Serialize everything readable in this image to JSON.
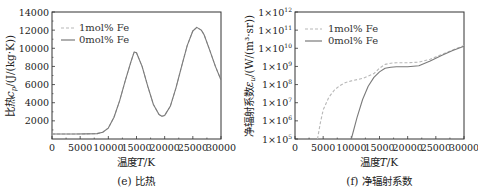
{
  "chart_data": [
    {
      "type": "line",
      "title": "",
      "caption": "(e) 比热",
      "xlabel": "温度T/K",
      "ylabel": "比热c_p/(J/(kg·K))",
      "xlim": [
        0,
        30000
      ],
      "ylim": [
        0,
        14000
      ],
      "x_ticks": [
        "0",
        "5000",
        "10000",
        "15000",
        "20000",
        "25000",
        "30000"
      ],
      "y_ticks": [
        "2000",
        "4000",
        "6000",
        "8000",
        "10000",
        "12000",
        "14000"
      ],
      "grid": false,
      "legend_position": "upper left",
      "x": [
        0,
        2000,
        4000,
        6000,
        8000,
        9000,
        10000,
        11000,
        12000,
        13000,
        14000,
        14600,
        15000,
        16000,
        17000,
        18000,
        19000,
        19500,
        20000,
        21000,
        22000,
        23000,
        24000,
        25000,
        25700,
        26500,
        27000,
        28000,
        29000,
        30000
      ],
      "series": [
        {
          "name": "1mol% Fe",
          "style": "dashed",
          "values": [
            550,
            550,
            550,
            560,
            600,
            750,
            1200,
            2400,
            4200,
            6400,
            8500,
            9600,
            9500,
            8000,
            5800,
            3800,
            2700,
            2500,
            2600,
            3600,
            5600,
            8000,
            10300,
            11900,
            12300,
            12000,
            11500,
            9800,
            8000,
            6500
          ]
        },
        {
          "name": "0mol% Fe",
          "style": "solid",
          "values": [
            550,
            550,
            550,
            560,
            600,
            750,
            1200,
            2400,
            4200,
            6400,
            8500,
            9600,
            9500,
            8000,
            5800,
            3800,
            2700,
            2500,
            2600,
            3600,
            5600,
            8000,
            10300,
            11900,
            12300,
            12000,
            11500,
            9800,
            8000,
            6500
          ]
        }
      ]
    },
    {
      "type": "line",
      "title": "",
      "caption": "(f) 净辐射系数",
      "xlabel": "温度T/K",
      "ylabel": "净辐射系数ε_u/(W/(m³·sr))",
      "xlim": [
        0,
        30000
      ],
      "ylim": [
        100000,
        1000000000000
      ],
      "yscale": "log",
      "x_ticks": [
        "0",
        "5000",
        "10000",
        "15000",
        "20000",
        "25000",
        "30000"
      ],
      "y_ticks": [
        "1×10^5",
        "1×10^6",
        "1×10^7",
        "1×10^8",
        "1×10^9",
        "1×10^10",
        "1×10^11",
        "1×10^12"
      ],
      "grid": false,
      "legend_position": "upper left",
      "series": [
        {
          "name": "1mol% Fe",
          "style": "dashed",
          "x": [
            4000,
            4500,
            5000,
            6000,
            7000,
            8000,
            9000,
            10000,
            12000,
            14000,
            15000,
            16000,
            17000,
            18000,
            20000,
            22000,
            24000,
            26000,
            28000,
            30000
          ],
          "values": [
            100000,
            800000,
            4000000,
            20000000,
            50000000,
            90000000,
            130000000,
            160000000,
            220000000,
            400000000,
            800000000,
            1300000000,
            1500000000,
            1600000000,
            1600000000,
            1700000000,
            2500000000,
            4500000000,
            8000000000,
            14000000000
          ]
        },
        {
          "name": "0mol% Fe",
          "style": "solid",
          "x": [
            10000,
            11000,
            12000,
            13000,
            14000,
            15000,
            16000,
            17000,
            18000,
            20000,
            22000,
            24000,
            26000,
            28000,
            30000
          ],
          "values": [
            100000,
            1500000,
            15000000,
            80000000,
            250000000,
            500000000,
            800000000,
            900000000,
            950000000,
            950000000,
            1100000000,
            2000000000,
            4000000000,
            7500000000,
            13000000000
          ]
        }
      ]
    }
  ],
  "left": {
    "caption": "(e) 比热",
    "xlabel_prefix": "温度",
    "xlabel_var": "T",
    "xlabel_unit": "/K",
    "ylabel_prefix": "比热",
    "ylabel_var": "c",
    "ylabel_sub": "p",
    "ylabel_unit": "/(J/(kg·K))",
    "legend": [
      "1mol%  Fe",
      "0mol%  Fe"
    ],
    "x_ticks": [
      "0",
      "5000",
      "10000",
      "15000",
      "20000",
      "25000",
      "30000"
    ],
    "y_ticks": [
      "2000",
      "4000",
      "6000",
      "8000",
      "10000",
      "12000",
      "14000"
    ]
  },
  "right": {
    "caption": "(f) 净辐射系数",
    "xlabel_prefix": "温度",
    "xlabel_var": "T",
    "xlabel_unit": "/K",
    "ylabel_prefix": "净辐射系数",
    "ylabel_var": "ε",
    "ylabel_sub": "u",
    "ylabel_unit": "/(W/(m³·sr))",
    "legend": [
      "1mol%  Fe",
      "0mol%  Fe"
    ],
    "x_ticks": [
      "0",
      "5000",
      "10000",
      "15000",
      "20000",
      "25000",
      "30000"
    ],
    "y_ticks_base": "1×10",
    "y_ticks_exp": [
      "5",
      "6",
      "7",
      "8",
      "9",
      "10",
      "11",
      "12"
    ]
  },
  "colors": {
    "dashed_series": "#b8b8b8",
    "solid_series": "#7a7a7a",
    "axis": "#333333"
  }
}
